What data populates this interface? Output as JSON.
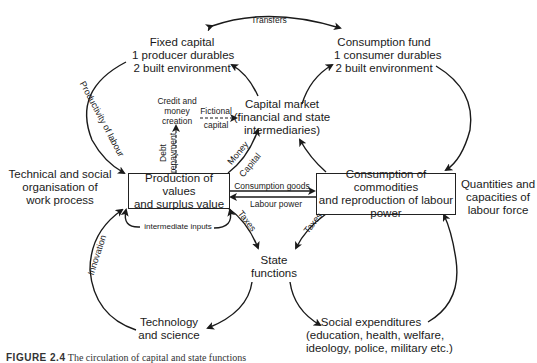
{
  "diagram": {
    "nodes": {
      "fixed_capital": {
        "lines": [
          "Fixed capital",
          "1 producer durables",
          "2 built environment"
        ]
      },
      "consumption_fund": {
        "lines": [
          "Consumption fund",
          "1 consumer durables",
          "2 built environment"
        ]
      },
      "capital_market": {
        "lines": [
          "Capital market",
          "(financial and state",
          "intermediaries)"
        ]
      },
      "credit_money": {
        "lines": [
          "Credit and",
          "money",
          "creation"
        ]
      },
      "technical_social": {
        "lines": [
          "Technical and social",
          "organisation of",
          "work process"
        ]
      },
      "production": {
        "lines": [
          "Production of values",
          "and surplus value"
        ]
      },
      "consumption": {
        "lines": [
          "Consumption of commodities",
          "and reproduction of labour",
          "power"
        ]
      },
      "quantities": {
        "lines": [
          "Quantities and",
          "capacities of",
          "labour force"
        ]
      },
      "state_functions": {
        "lines": [
          "State",
          "functions"
        ]
      },
      "technology": {
        "lines": [
          "Technology",
          "and science"
        ]
      },
      "social_expenditures": {
        "lines": [
          "Social expenditures",
          "(education, health, welfare,",
          "ideology, police, military etc.)"
        ]
      }
    },
    "edge_labels": {
      "transfers": "Transfers",
      "productivity": "Productivity of labour",
      "fictional_capital": [
        "Fictional",
        "capital"
      ],
      "debt_repayment": [
        "Debt",
        "repayment"
      ],
      "money_capital": [
        "Money",
        "Capital"
      ],
      "consumption_goods": "Consumption goods",
      "labour_power": "Labour power",
      "taxes_left": "Taxes",
      "taxes_right": "Taxes",
      "intermediate_inputs": "intermediate inputs",
      "innovation": "Innovation"
    }
  },
  "caption": {
    "label": "FIGURE 2.4",
    "text": "The circulation of capital and state functions"
  }
}
